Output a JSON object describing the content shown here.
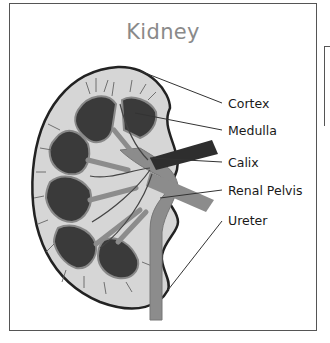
{
  "diagram": {
    "title": "Kidney",
    "labels": [
      {
        "id": "cortex",
        "text": "Cortex"
      },
      {
        "id": "medulla",
        "text": "Medulla"
      },
      {
        "id": "calix",
        "text": "Calix"
      },
      {
        "id": "renal-pelvis",
        "text": "Renal Pelvis"
      },
      {
        "id": "ureter",
        "text": "Ureter"
      }
    ],
    "colors": {
      "frame": "#555555",
      "title": "#8a8a8a",
      "cortex_fill": "#d6d6d6",
      "medulla_fill": "#3a3a3a",
      "vessel": "#8c8c8c",
      "artery": "#2e2e2e",
      "outline": "#222222"
    }
  }
}
